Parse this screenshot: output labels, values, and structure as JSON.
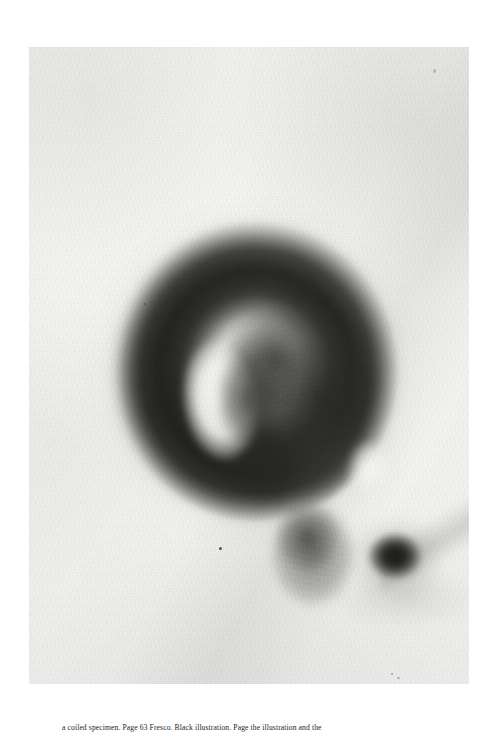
{
  "page": {
    "background_color": "#ffffff",
    "width": 497,
    "height": 733
  },
  "plate": {
    "alt_name": "photographic-plate",
    "description": "Black and white photographic plate of a tightly coiled specimen forming a thick dark ring with a mottled fibrous core, a bright crescent void at the left inside of the coil, a lower protruding limb and a small very dark rounded blob at the lower right.",
    "tones": {
      "paper": "#f4f4f3",
      "highlight": "#fafaf8",
      "midtone": "#9a9a97",
      "shadow": "#3a3a37",
      "deepest": "#161614"
    },
    "geometry": {
      "left": 29,
      "top": 47,
      "width": 440,
      "height": 637
    }
  },
  "caption": {
    "text": "a coiled specimen. Page 63 Fresco. Black illustration. Page the illustration and the",
    "visible": "partially-clipped-at-page-bottom"
  }
}
